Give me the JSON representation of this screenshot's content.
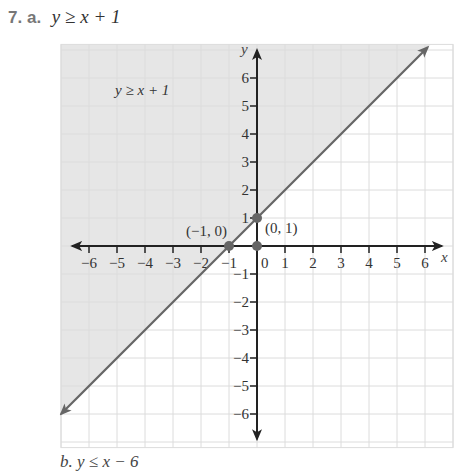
{
  "problem": {
    "number": "7.",
    "part": "a.",
    "expression": "y ≥ x + 1"
  },
  "next_problem_partial": "b.  y ≤ x − 6",
  "chart_data": {
    "type": "line",
    "title": "y ≥ x + 1",
    "xlabel": "x",
    "ylabel": "y",
    "xlim": [
      -7,
      7
    ],
    "ylim": [
      -7.2,
      7.2
    ],
    "grid": true,
    "x_ticks": [
      -6,
      -5,
      -4,
      -3,
      -2,
      -1,
      0,
      1,
      2,
      3,
      4,
      5,
      6
    ],
    "y_ticks": [
      -6,
      -5,
      -4,
      -3,
      -2,
      -1,
      1,
      2,
      3,
      4,
      5,
      6
    ],
    "x_tick_labels": [
      "−6",
      "−5",
      "−4",
      "−3",
      "−2",
      "−1",
      "1",
      "2",
      "3",
      "4",
      "5",
      "6"
    ],
    "y_tick_labels": [
      "6",
      "5",
      "4",
      "3",
      "2",
      "1",
      "−1",
      "−2",
      "−3",
      "−4",
      "−5",
      "−6"
    ],
    "origin_label": "0",
    "boundary_line": {
      "equation": "y = x + 1",
      "slope": 1,
      "intercept": 1,
      "style": "solid",
      "from": [
        -7,
        -6
      ],
      "to": [
        6.1,
        7.1
      ]
    },
    "shaded_region": "above line (y ≥ x + 1)",
    "region_label": "y ≥ x + 1",
    "points": [
      {
        "x": -1,
        "y": 0,
        "label": "(−1, 0)"
      },
      {
        "x": 0,
        "y": 1,
        "label": "(0, 1)"
      },
      {
        "x": 0,
        "y": 0,
        "label": ""
      }
    ],
    "colors": {
      "shade": "#e6e6e6",
      "line": "#666666",
      "axis": "#222222",
      "grid": "#dcdcdc",
      "point": "#666666"
    }
  }
}
